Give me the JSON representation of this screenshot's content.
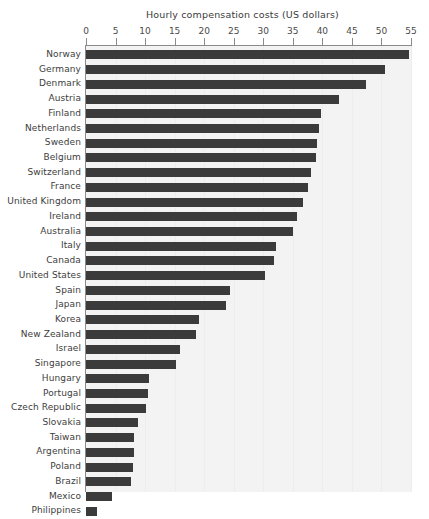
{
  "chart_data": {
    "type": "bar",
    "orientation": "horizontal",
    "title": "Hourly compensation costs (US dollars)",
    "xlabel": "",
    "ylabel": "",
    "xlim": [
      0,
      55
    ],
    "xticks": [
      0,
      5,
      10,
      15,
      20,
      25,
      30,
      35,
      40,
      45,
      50,
      55
    ],
    "grid": true,
    "legend": null,
    "bar_color": "#3b3b3b",
    "plot_background": "#f3f3f3",
    "categories": [
      "Norway",
      "Germany",
      "Denmark",
      "Austria",
      "Finland",
      "Netherlands",
      "Sweden",
      "Belgium",
      "Switzerland",
      "France",
      "United Kingdom",
      "Ireland",
      "Australia",
      "Italy",
      "Canada",
      "United States",
      "Spain",
      "Japan",
      "Korea",
      "New Zealand",
      "Israel",
      "Singapore",
      "Hungary",
      "Portugal",
      "Czech Republic",
      "Slovakia",
      "Taiwan",
      "Argentina",
      "Poland",
      "Brazil",
      "Mexico",
      "Philippines"
    ],
    "values": [
      54.6,
      50.6,
      47.4,
      42.8,
      39.8,
      39.4,
      39.1,
      38.9,
      38.1,
      37.6,
      36.7,
      35.7,
      35.0,
      32.1,
      31.8,
      30.3,
      24.4,
      23.7,
      19.1,
      18.6,
      15.9,
      15.2,
      10.7,
      10.5,
      10.1,
      8.8,
      8.1,
      8.1,
      8.0,
      7.6,
      4.4,
      1.9
    ]
  }
}
